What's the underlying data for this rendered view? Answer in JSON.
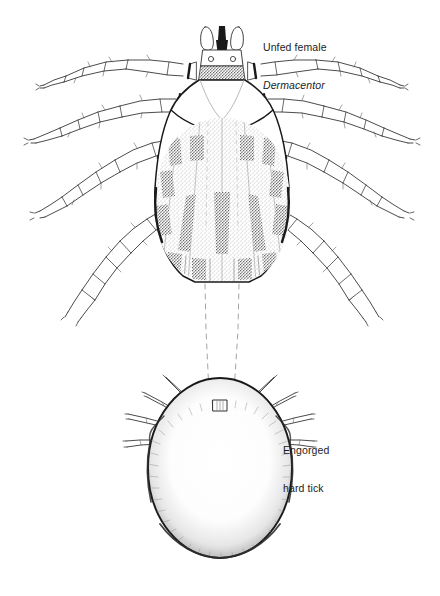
{
  "figure": {
    "kind": "line-drawing",
    "background_color": "#ffffff",
    "ink_color": "#1c1c1c"
  },
  "labels": {
    "unfed": {
      "line1": "Unfed female",
      "line2_scientific": "Dermacentor"
    },
    "engorged": {
      "line1": "Engorged",
      "line2": "hard tick"
    }
  },
  "caption": {
    "cut_off_text": "   "
  },
  "specimens": {
    "unfed": {
      "name": "unfed-female-dermacentor",
      "leg_count": 8,
      "has_ornate_scutum": true,
      "has_capitulum": true,
      "has_festoons": true
    },
    "engorged": {
      "name": "engorged-hard-tick",
      "leg_count": 8,
      "body_shape": "oval",
      "has_capitulum": true
    }
  },
  "connector": {
    "name": "size-comparison-dashed-lines",
    "style": "dashed",
    "count": 2
  }
}
